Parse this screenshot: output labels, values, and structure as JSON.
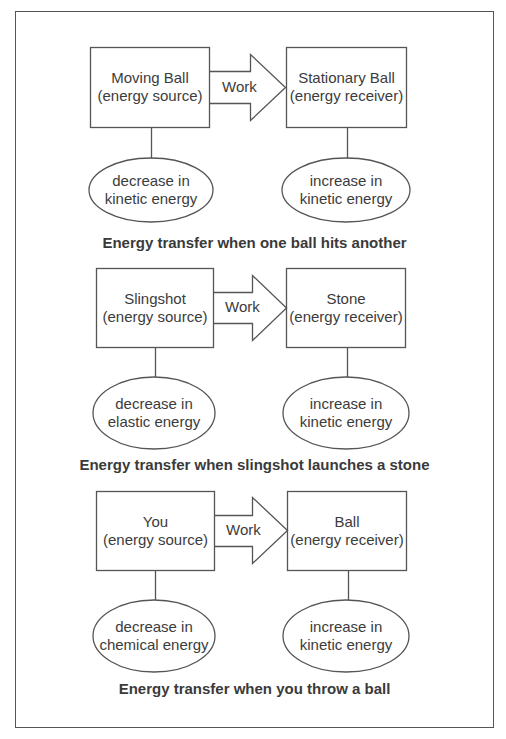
{
  "diagram": {
    "sections": [
      {
        "source": {
          "name": "Moving Ball",
          "role": "(energy source)"
        },
        "arrow_label": "Work",
        "receiver": {
          "name": "Stationary Ball",
          "role": "(energy receiver)"
        },
        "source_effect": {
          "line1": "decrease in",
          "line2": "kinetic energy"
        },
        "receiver_effect": {
          "line1": "increase in",
          "line2": "kinetic energy"
        },
        "caption": "Energy transfer when one ball hits another"
      },
      {
        "source": {
          "name": "Slingshot",
          "role": "(energy source)"
        },
        "arrow_label": "Work",
        "receiver": {
          "name": "Stone",
          "role": "(energy receiver)"
        },
        "source_effect": {
          "line1": "decrease in",
          "line2": "elastic energy"
        },
        "receiver_effect": {
          "line1": "increase in",
          "line2": "kinetic energy"
        },
        "caption": "Energy transfer when slingshot launches a stone"
      },
      {
        "source": {
          "name": "You",
          "role": "(energy source)"
        },
        "arrow_label": "Work",
        "receiver": {
          "name": "Ball",
          "role": "(energy receiver)"
        },
        "source_effect": {
          "line1": "decrease in",
          "line2": "chemical energy"
        },
        "receiver_effect": {
          "line1": "increase in",
          "line2": "kinetic energy"
        },
        "caption": "Energy transfer when you throw a ball"
      }
    ]
  },
  "colors": {
    "stroke": "#555555",
    "text": "#3c3c3c",
    "background": "#ffffff"
  }
}
